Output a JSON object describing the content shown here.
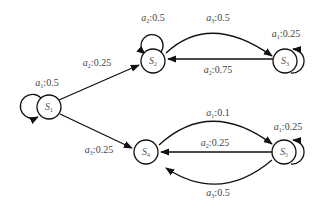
{
  "diagram": {
    "type": "state-transition",
    "nodes": [
      {
        "id": "S1",
        "name": "S",
        "sub": "1",
        "x": 49,
        "y": 107
      },
      {
        "id": "S2",
        "name": "S",
        "sub": "2",
        "x": 153,
        "y": 61
      },
      {
        "id": "S3",
        "name": "S",
        "sub": "3",
        "x": 287,
        "y": 61
      },
      {
        "id": "S4",
        "name": "S",
        "sub": "4",
        "x": 146,
        "y": 152
      },
      {
        "id": "S5",
        "name": "S",
        "sub": "5",
        "x": 286,
        "y": 152
      }
    ],
    "edges": [
      {
        "from": "S1",
        "to": "S1",
        "action": "a",
        "action_sub": "1",
        "prob": ":0.5",
        "lx": 47,
        "ly": 83
      },
      {
        "from": "S1",
        "to": "S2",
        "action": "a",
        "action_sub": "2",
        "prob": ":0.25",
        "lx": 97,
        "ly": 63
      },
      {
        "from": "S1",
        "to": "S4",
        "action": "a",
        "action_sub": "3",
        "prob": ":0.25",
        "lx": 99,
        "ly": 150
      },
      {
        "from": "S2",
        "to": "S2",
        "action": "a",
        "action_sub": "2",
        "prob": ":0.5",
        "lx": 153,
        "ly": 18
      },
      {
        "from": "S2",
        "to": "S3",
        "action": "a",
        "action_sub": "3",
        "prob": ":0.5",
        "lx": 218,
        "ly": 18
      },
      {
        "from": "S3",
        "to": "S2",
        "action": "a",
        "action_sub": "2",
        "prob": ":0.75",
        "lx": 218,
        "ly": 70
      },
      {
        "from": "S3",
        "to": "S3",
        "action": "a",
        "action_sub": "1",
        "prob": ":0.25",
        "lx": 286,
        "ly": 34
      },
      {
        "from": "S4",
        "to": "S5",
        "action": "a",
        "action_sub": "1",
        "prob": ":0.1",
        "lx": 218,
        "ly": 113
      },
      {
        "from": "S5",
        "to": "S4",
        "action": "a",
        "action_sub": "2",
        "prob": ":0.25",
        "lx": 215,
        "ly": 143
      },
      {
        "from": "S5",
        "to": "S4",
        "action": "a",
        "action_sub": "3",
        "prob": ":0.5",
        "lx": 218,
        "ly": 193
      },
      {
        "from": "S5",
        "to": "S5",
        "action": "a",
        "action_sub": "1",
        "prob": ":0.25",
        "lx": 288,
        "ly": 127
      }
    ]
  }
}
